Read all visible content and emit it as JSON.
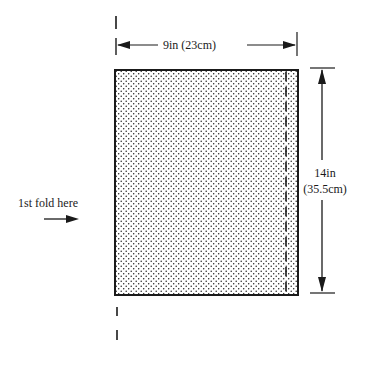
{
  "diagram": {
    "width_dimension": {
      "label": "9in (23cm)"
    },
    "height_dimension": {
      "line1": "14in",
      "line2": "(35.5cm)"
    },
    "fold_instruction": {
      "label": "1st fold here"
    }
  },
  "colors": {
    "ink": "#1a1a1a",
    "background": "#ffffff"
  }
}
